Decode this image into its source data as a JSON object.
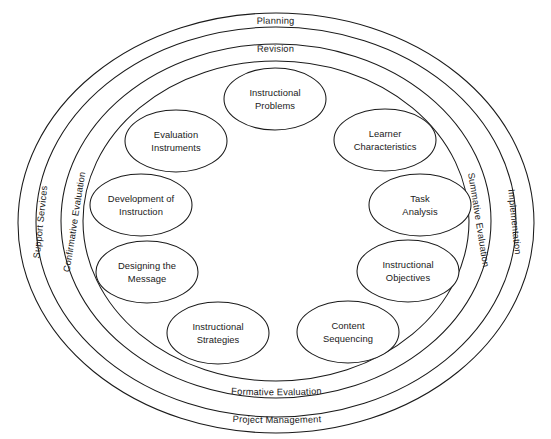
{
  "diagram": {
    "background_color": "#ffffff",
    "line_color": "#1a1a1a",
    "rings": [
      {
        "id": "project-management",
        "label": "Project Management",
        "position": "bottom",
        "level": 1
      },
      {
        "id": "planning",
        "label": "Planning",
        "position": "top",
        "level": 1
      },
      {
        "id": "support-services",
        "label": "Support Services",
        "position": "left",
        "level": 1
      },
      {
        "id": "implementation",
        "label": "Implementation",
        "position": "right",
        "level": 1
      },
      {
        "id": "revision",
        "label": "Revision",
        "position": "top",
        "level": 2
      },
      {
        "id": "formative-evaluation",
        "label": "Formative Evaluation",
        "position": "bottom",
        "level": 2
      },
      {
        "id": "confirmative-evaluation",
        "label": "Confirmative Evaluation",
        "position": "left",
        "level": 2
      },
      {
        "id": "summative-evaluation",
        "label": "Summative Evaluation",
        "position": "right",
        "level": 2
      }
    ],
    "nodes": [
      {
        "id": "instructional-problems",
        "line1": "Instructional",
        "line2": "Problems",
        "cx": 275,
        "cy": 99,
        "rx": 50,
        "ry": 31
      },
      {
        "id": "learner-characteristics",
        "line1": "Learner",
        "line2": "Characteristics",
        "cx": 385,
        "cy": 140,
        "rx": 50,
        "ry": 31
      },
      {
        "id": "task-analysis",
        "line1": "Task",
        "line2": "Analysis",
        "cx": 420,
        "cy": 205,
        "rx": 50,
        "ry": 31
      },
      {
        "id": "instructional-objectives",
        "line1": "Instructional",
        "line2": "Objectives",
        "cx": 408,
        "cy": 271,
        "rx": 50,
        "ry": 31
      },
      {
        "id": "content-sequencing",
        "line1": "Content",
        "line2": "Sequencing",
        "cx": 348,
        "cy": 332,
        "rx": 50,
        "ry": 31
      },
      {
        "id": "instructional-strategies",
        "line1": "Instructional",
        "line2": "Strategies",
        "cx": 218,
        "cy": 333,
        "rx": 50,
        "ry": 31
      },
      {
        "id": "designing-the-message",
        "line1": "Designing the",
        "line2": "Message",
        "cx": 147,
        "cy": 272,
        "rx": 50,
        "ry": 31
      },
      {
        "id": "development-of-instruction",
        "line1": "Development of",
        "line2": "Instruction",
        "cx": 141,
        "cy": 205,
        "rx": 50,
        "ry": 31
      },
      {
        "id": "evaluation-instruments",
        "line1": "Evaluation",
        "line2": "Instruments",
        "cx": 176,
        "cy": 141,
        "rx": 50,
        "ry": 31
      }
    ]
  }
}
